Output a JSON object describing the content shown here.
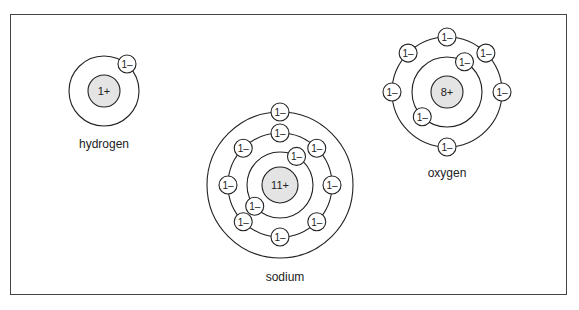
{
  "atoms": [
    {
      "name": "hydrogen",
      "nucleus_label": "1+",
      "electron_label": "1–",
      "shells": [
        1
      ],
      "center": [
        104,
        91
      ]
    },
    {
      "name": "sodium",
      "nucleus_label": "11+",
      "electron_label": "1–",
      "shells": [
        2,
        8,
        1
      ],
      "center": [
        280,
        185
      ]
    },
    {
      "name": "oxygen",
      "nucleus_label": "8+",
      "electron_label": "1–",
      "shells": [
        2,
        6
      ],
      "center": [
        447,
        92
      ]
    }
  ],
  "colors": {
    "nucleus_fill": "#e4e4e4",
    "line": "#222222"
  }
}
